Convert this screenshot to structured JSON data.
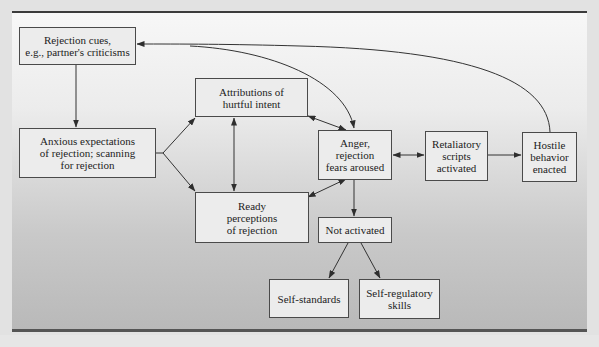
{
  "figure": {
    "title_clipped": "",
    "colors": {
      "panel_top": "#f7f7f7",
      "panel_bottom": "#b9b9b9",
      "box_fill": "#ececec",
      "box_border": "#4a4a4a",
      "arrow": "#333333",
      "rule": "#3b3b3b"
    }
  },
  "nodes": {
    "rejection_cues": "Rejection cues,\ne.g., partner's criticisms",
    "anxious_expectations": "Anxious expectations\nof rejection; scanning\nfor rejection",
    "attributions": "Attributions of\nhurtful intent",
    "ready_perceptions": "Ready\nperceptions\nof rejection",
    "anger": "Anger,\nrejection\nfears aroused",
    "retaliatory": "Retaliatory\nscripts\nactivated",
    "hostile": "Hostile\nbehavior\nenacted",
    "not_activated": "Not activated",
    "self_standards": "Self-standards",
    "self_regulatory": "Self-regulatory\nskills"
  },
  "edges": [
    {
      "from": "rejection_cues",
      "to": "anxious_expectations",
      "type": "one-way"
    },
    {
      "from": "anxious_expectations",
      "to": "attributions",
      "type": "fork-bidirectional"
    },
    {
      "from": "anxious_expectations",
      "to": "ready_perceptions",
      "type": "fork-bidirectional"
    },
    {
      "from": "attributions",
      "to": "ready_perceptions",
      "type": "two-way"
    },
    {
      "from": "attributions",
      "to": "anger",
      "type": "two-way"
    },
    {
      "from": "ready_perceptions",
      "to": "anger",
      "type": "two-way"
    },
    {
      "from": "rejection_cues",
      "to": "anger",
      "type": "one-way-curved"
    },
    {
      "from": "anger",
      "to": "retaliatory",
      "type": "two-way"
    },
    {
      "from": "retaliatory",
      "to": "hostile",
      "type": "one-way"
    },
    {
      "from": "hostile",
      "to": "rejection_cues",
      "type": "one-way-curved-feedback"
    },
    {
      "from": "anger",
      "to": "not_activated",
      "type": "one-way"
    },
    {
      "from": "not_activated",
      "to": "self_standards",
      "type": "one-way"
    },
    {
      "from": "not_activated",
      "to": "self_regulatory",
      "type": "one-way"
    }
  ]
}
